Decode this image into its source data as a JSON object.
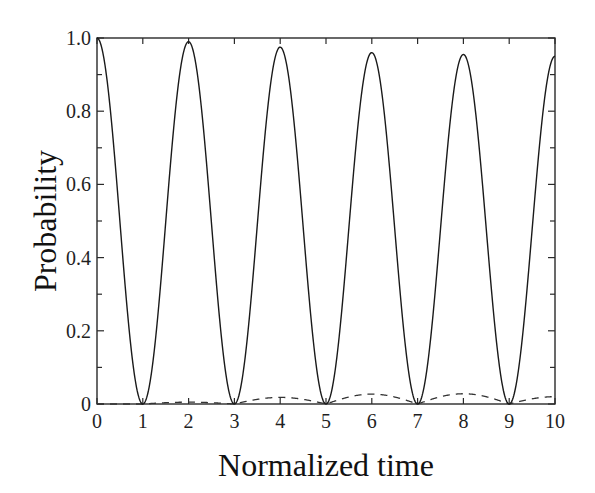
{
  "chart_data": {
    "type": "line",
    "title": "",
    "xlabel": "Normalized time",
    "ylabel": "Probability",
    "xlim": [
      0,
      10
    ],
    "ylim": [
      0,
      1.0
    ],
    "x_ticks": [
      0,
      1,
      2,
      3,
      4,
      5,
      6,
      7,
      8,
      9,
      10
    ],
    "x_tick_labels": [
      "0",
      "1",
      "2",
      "3",
      "4",
      "5",
      "6",
      "7",
      "8",
      "9",
      "10"
    ],
    "y_ticks": [
      0,
      0.2,
      0.4,
      0.6,
      0.8,
      1.0
    ],
    "y_tick_labels": [
      "0",
      "0.2",
      "0.4",
      "0.6",
      "0.8",
      "1.0"
    ],
    "grid": false,
    "legend": null,
    "series": [
      {
        "name": "solid",
        "style": "solid",
        "color": "#1a1a1a",
        "x": [
          0,
          1,
          2,
          3,
          4,
          5,
          6,
          7,
          8,
          9,
          10
        ],
        "values": [
          1.0,
          0.0,
          0.99,
          0.0,
          0.975,
          0.0,
          0.96,
          0.0,
          0.955,
          0.0,
          0.95
        ],
        "description": "Oscillation with period ~2, slowly decaying peak amplitude"
      },
      {
        "name": "dashed",
        "style": "dashed",
        "color": "#333333",
        "x": [
          0,
          1,
          2,
          3,
          4,
          5,
          6,
          7,
          8,
          9,
          10
        ],
        "values": [
          0.0,
          0.0,
          0.005,
          0.0,
          0.018,
          0.0,
          0.027,
          0.0,
          0.028,
          0.0,
          0.02
        ],
        "description": "Small complementary bumps between zero crossings"
      }
    ]
  }
}
